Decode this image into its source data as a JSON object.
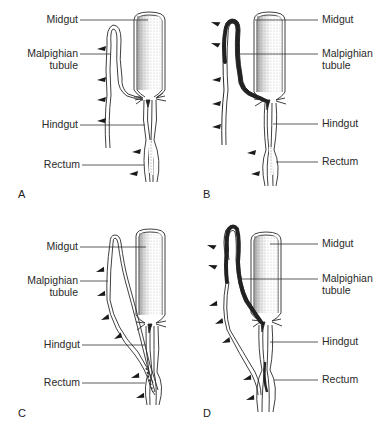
{
  "figure": {
    "panels": [
      {
        "id": "A",
        "letter": "A",
        "labels": {
          "midgut": "Midgut",
          "malpighian_line1": "Malpighian",
          "malpighian_line2": "tubule",
          "hindgut": "Hindgut",
          "rectum": "Rectum"
        },
        "labels_side": "left",
        "tubule_stained": "none"
      },
      {
        "id": "B",
        "letter": "B",
        "labels": {
          "midgut": "Midgut",
          "malpighian_line1": "Malpighian",
          "malpighian_line2": "tubule",
          "hindgut": "Hindgut",
          "rectum": "Rectum"
        },
        "labels_side": "right",
        "tubule_stained": "distal-and-proximal-limb"
      },
      {
        "id": "C",
        "letter": "C",
        "labels": {
          "midgut": "Midgut",
          "malpighian_line1": "Malpighian",
          "malpighian_line2": "tubule",
          "hindgut": "Hindgut",
          "rectum": "Rectum"
        },
        "labels_side": "left",
        "tubule_stained": "none (cryptonephric, associated with rectum)"
      },
      {
        "id": "D",
        "letter": "D",
        "labels": {
          "midgut": "Midgut",
          "malpighian_line1": "Malpighian",
          "malpighian_line2": "tubule",
          "hindgut": "Hindgut",
          "rectum": "Rectum"
        },
        "labels_side": "right",
        "tubule_stained": "distal-and-proximal-limb (cryptonephric)"
      }
    ],
    "colors": {
      "ink": "#2a2a2a",
      "stipple": "#9a9a9a",
      "stain": "#2b2b2b",
      "background": "#ffffff"
    }
  }
}
